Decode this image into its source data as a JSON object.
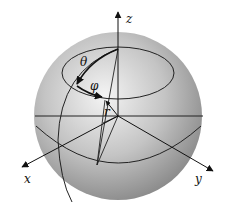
{
  "diagram": {
    "axes": {
      "x_label": "x",
      "y_label": "y",
      "z_label": "z"
    },
    "symbols": {
      "theta": "θ",
      "phi": "φ",
      "radius": "r"
    },
    "colors": {
      "sphere_light": "#f2f2f2",
      "sphere_dark": "#8a8a8a",
      "line": "#111111"
    }
  }
}
